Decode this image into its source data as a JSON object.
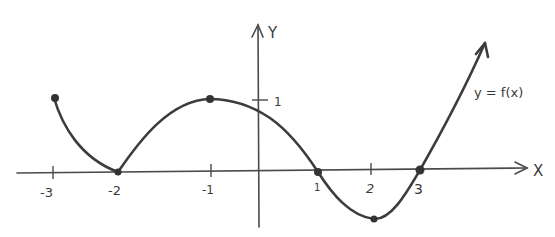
{
  "diagram": {
    "axes": {
      "x_label": "X",
      "y_label": "Y",
      "x_ticks": [
        {
          "value": -3,
          "label": "-3"
        },
        {
          "value": -2,
          "label": "-2"
        },
        {
          "value": -1,
          "label": "-1"
        },
        {
          "value": 1,
          "label": "1"
        },
        {
          "value": 2,
          "label": "2"
        },
        {
          "value": 3,
          "label": "3"
        }
      ],
      "y_ticks": [
        {
          "value": 1,
          "label": "1"
        }
      ]
    },
    "function_label": "y = f(x)",
    "marked_points": [
      {
        "x": -3,
        "y": 1,
        "note": "left endpoint"
      },
      {
        "x": -2,
        "y": 0,
        "note": "root / local min"
      },
      {
        "x": -1,
        "y": 1,
        "note": "local max"
      },
      {
        "x": 1,
        "y": 0,
        "note": "root"
      },
      {
        "x": 2,
        "y": -0.67,
        "note": "local min"
      },
      {
        "x": 3,
        "y": 0,
        "note": "root"
      }
    ],
    "curve_end": "arrow continuing upward to the right",
    "colors": {
      "background": "#ffffff",
      "ink": "#3c3c3c"
    }
  }
}
